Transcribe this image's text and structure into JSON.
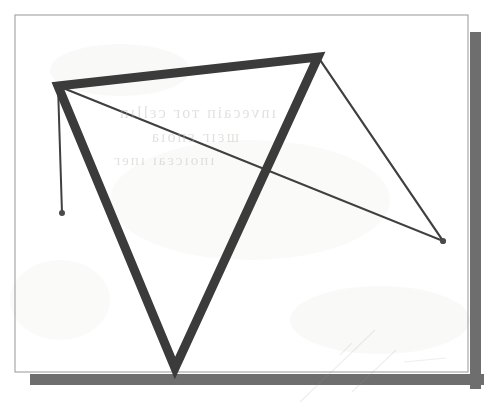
{
  "figure": {
    "page": {
      "background_color": "#ffffff",
      "border_color": "#a8a8a8",
      "shadow_color": "#6e6e6e",
      "x": 15,
      "y": 15,
      "width": 453,
      "height": 357,
      "shadow_offset_x": 10,
      "shadow_offset_y": 12
    },
    "stroke_colors": {
      "thick": "#3a3a3a",
      "thin": "#3f3f3f",
      "dot": "#4a4a4a"
    },
    "stroke_widths": {
      "thick": 9,
      "thin": 2.2,
      "vertical": 2.0
    },
    "ghost_text": {
      "line1": "ınveсаiп тог сεllıп",
      "line2": "шεıг εпоıа",
      "line3": "ıпоıсεаı ıпег"
    },
    "shapes": [
      {
        "name": "thick-triangle",
        "kind": "polygon",
        "stroke": "thick",
        "points": [
          [
            58,
            86
          ],
          [
            318,
            57
          ],
          [
            175,
            368
          ]
        ]
      },
      {
        "name": "thin-triangle",
        "kind": "polygon",
        "stroke": "thin",
        "points": [
          [
            58,
            86
          ],
          [
            318,
            57
          ],
          [
            443,
            241
          ]
        ]
      },
      {
        "name": "thin-vertical-segment",
        "kind": "segment",
        "stroke": "vertical",
        "points": [
          [
            58,
            86
          ],
          [
            62,
            213
          ]
        ]
      }
    ],
    "vertices": [
      {
        "name": "vertex-top-left",
        "x": 58,
        "y": 86,
        "marked": false
      },
      {
        "name": "vertex-top-right",
        "x": 318,
        "y": 57,
        "marked": false
      },
      {
        "name": "vertex-bottom",
        "x": 175,
        "y": 368,
        "marked": false
      },
      {
        "name": "vertex-right",
        "x": 443,
        "y": 241,
        "marked": true
      },
      {
        "name": "vertex-segment-end",
        "x": 62,
        "y": 213,
        "marked": true
      }
    ]
  }
}
